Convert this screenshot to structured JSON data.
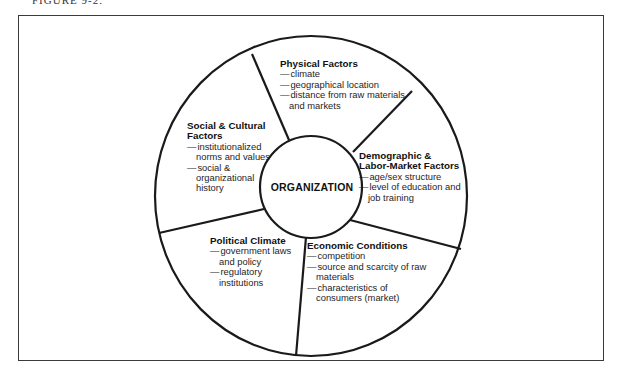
{
  "figure": {
    "label": "FIGURE 9-2."
  },
  "diagram": {
    "center": "ORGANIZATION",
    "segments": [
      {
        "title": "Physical Factors",
        "items": [
          "climate",
          "geographical location",
          "distance from raw materials and markets"
        ]
      },
      {
        "title": "Demographic & Labor-Market Factors",
        "items": [
          "age/sex structure",
          "level of education and job training"
        ]
      },
      {
        "title": "Economic Conditions",
        "items": [
          "competition",
          "source and scarcity of raw materials",
          "characteristics of consumers (market)"
        ]
      },
      {
        "title": "Political Climate",
        "items": [
          "government laws and policy",
          "regulatory institutions"
        ]
      },
      {
        "title": "Social & Cultural Factors",
        "items": [
          "institutionalized norms and values",
          "social & organizational history"
        ]
      }
    ],
    "colors": {
      "stroke": "#1a1a1a",
      "background": "#ffffff"
    }
  }
}
